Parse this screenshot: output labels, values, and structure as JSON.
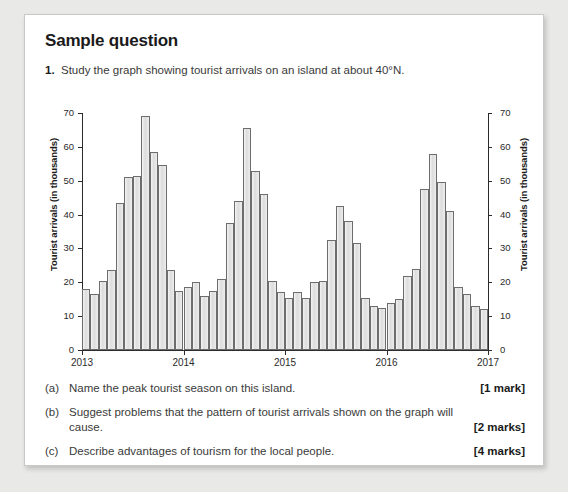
{
  "heading": "Sample question",
  "question": {
    "number": "1.",
    "text": "Study the graph showing tourist arrivals on an island at about 40°N."
  },
  "parts": [
    {
      "tag": "(a)",
      "text": "Name the peak tourist season on this island.",
      "marks": "[1 mark]"
    },
    {
      "tag": "(b)",
      "text": "Suggest problems that the pattern of tourist arrivals shown on the graph will cause.",
      "marks": "[2 marks]"
    },
    {
      "tag": "(c)",
      "text": "Describe advantages of tourism for the local people.",
      "marks": "[4 marks]"
    }
  ],
  "chart_data": {
    "type": "bar",
    "title": "",
    "xlabel": "",
    "ylabel": "Tourist arrivals (in thousands)",
    "ylabel_right": "Tourist arrivals (in thousands)",
    "ylim": [
      0,
      70
    ],
    "yticks": [
      0,
      10,
      20,
      30,
      40,
      50,
      60,
      70
    ],
    "xlim": [
      2013,
      2017
    ],
    "xticks": [
      2013,
      2014,
      2015,
      2016,
      2017
    ],
    "xticklabels": [
      "2013",
      "2014",
      "2015",
      "2016",
      "2017"
    ],
    "grid": false,
    "legend": null,
    "bar_color": "#e2e2e2",
    "bar_edge_color": "#6d6d6d",
    "axis_color": "#2b2b2b",
    "categories": [
      "2013-01",
      "2013-02",
      "2013-03",
      "2013-04",
      "2013-05",
      "2013-06",
      "2013-07",
      "2013-08",
      "2013-09",
      "2013-10",
      "2013-11",
      "2013-12",
      "2014-01",
      "2014-02",
      "2014-03",
      "2014-04",
      "2014-05",
      "2014-06",
      "2014-07",
      "2014-08",
      "2014-09",
      "2014-10",
      "2014-11",
      "2014-12",
      "2015-01",
      "2015-02",
      "2015-03",
      "2015-04",
      "2015-05",
      "2015-06",
      "2015-07",
      "2015-08",
      "2015-09",
      "2015-10",
      "2015-11",
      "2015-12",
      "2016-01",
      "2016-02",
      "2016-03",
      "2016-04",
      "2016-05",
      "2016-06",
      "2016-07",
      "2016-08",
      "2016-09",
      "2016-10",
      "2016-11",
      "2016-12"
    ],
    "values": [
      18,
      16.5,
      20.5,
      23.5,
      43.5,
      51,
      51.5,
      69,
      58.5,
      54.5,
      23.5,
      17.5,
      18.5,
      20,
      16,
      17.5,
      21,
      37.5,
      44,
      65.5,
      53,
      46,
      20.5,
      17,
      15.5,
      17,
      15.5,
      20,
      20.5,
      32.5,
      42.5,
      38,
      31.5,
      15.5,
      13,
      12.5,
      14,
      15,
      22,
      24,
      47.5,
      58,
      49.5,
      41,
      18.5,
      16.5,
      13,
      12
    ]
  }
}
